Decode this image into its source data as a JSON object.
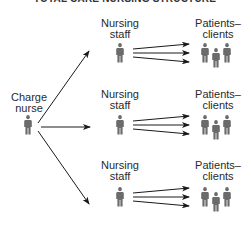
{
  "title": "TOTAL CARE NURSING STRUCTURE",
  "charge_nurse": {
    "label_line1": "Charge",
    "label_line2": "nurse"
  },
  "groups": [
    {
      "staff_label_line1": "Nursing",
      "staff_label_line2": "staff",
      "patients_label_line1": "Patients–",
      "patients_label_line2": "clients"
    },
    {
      "staff_label_line1": "Nursing",
      "staff_label_line2": "staff",
      "patients_label_line1": "Patients–",
      "patients_label_line2": "clients"
    },
    {
      "staff_label_line1": "Nursing",
      "staff_label_line2": "staff",
      "patients_label_line1": "Patients–",
      "patients_label_line2": "clients"
    }
  ],
  "colors": {
    "figure": "#6b6b6b",
    "arrow": "#1a1a1a",
    "text": "#2a2a2a"
  }
}
